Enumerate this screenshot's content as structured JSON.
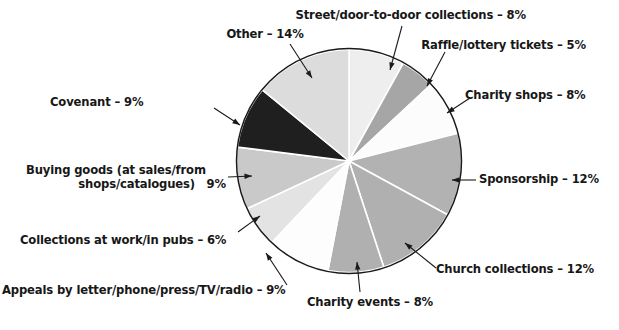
{
  "figure": {
    "type": "pie-chart-figure",
    "background": "#ffffff",
    "outline_color": "#1a1a1a",
    "leader_line_color": "#1a1a1a"
  },
  "chart_data": {
    "type": "pie",
    "title": "",
    "subtitle": "",
    "xlabel": "",
    "ylabel": "",
    "grid": false,
    "legend_position": "none",
    "label_style": "callout-with-leader-arrows",
    "units": "percent",
    "start_angle_deg": 0,
    "direction": "clockwise",
    "total": 100,
    "categories": [
      "Street/door-to-door collections",
      "Raffle/lottery tickets",
      "Charity shops",
      "Sponsorship",
      "Church collections",
      "Charity events",
      "Appeals by letter/phone/press/TV/radio",
      "Collections at work/in pubs",
      "Buying goods (at sales/from shops/catalogues)",
      "Covenant",
      "Other"
    ],
    "values": [
      8,
      5,
      8,
      12,
      12,
      8,
      9,
      6,
      9,
      9,
      14
    ],
    "colors": [
      "#eeeeee",
      "#a6a6a6",
      "#fcfcfc",
      "#b2b2b2",
      "#b0b0b0",
      "#b0b0b0",
      "#fdfdfd",
      "#e3e3e3",
      "#c9c9c9",
      "#201f1f",
      "#dcdcdc"
    ],
    "slices": [
      {
        "label": "Street/door-to-door collections",
        "value": 8,
        "display": "Street/door-to-door collections – 8%",
        "color": "#eeeeee"
      },
      {
        "label": "Raffle/lottery tickets",
        "value": 5,
        "display": "Raffle/lottery tickets – 5%",
        "color": "#a6a6a6"
      },
      {
        "label": "Charity shops",
        "value": 8,
        "display": "Charity shops – 8%",
        "color": "#fcfcfc"
      },
      {
        "label": "Sponsorship",
        "value": 12,
        "display": "Sponsorship – 12%",
        "color": "#b2b2b2"
      },
      {
        "label": "Church collections",
        "value": 12,
        "display": "Church collections – 12%",
        "color": "#b0b0b0"
      },
      {
        "label": "Charity events",
        "value": 8,
        "display": "Charity events – 8%",
        "color": "#b0b0b0"
      },
      {
        "label": "Appeals by letter/phone/press/TV/radio",
        "value": 9,
        "display": "Appeals by letter/phone/press/TV/radio – 9%",
        "color": "#fdfdfd"
      },
      {
        "label": "Collections at work/in pubs",
        "value": 6,
        "display": "Collections at work/in pubs – 6%",
        "color": "#e3e3e3"
      },
      {
        "label": "Buying goods (at sales/from shops/catalogues)",
        "value": 9,
        "display": "Buying goods (at sales/from shops/catalogues)  9%",
        "color": "#c9c9c9"
      },
      {
        "label": "Covenant",
        "value": 9,
        "display": "Covenant – 9%",
        "color": "#201f1f"
      },
      {
        "label": "Other",
        "value": 14,
        "display": "Other – 14%",
        "color": "#dcdcdc"
      }
    ]
  },
  "labels": {
    "street": "Street/door-to-door collections – 8%",
    "raffle": "Raffle/lottery tickets – 5%",
    "charity_shops": "Charity shops – 8%",
    "sponsorship": "Sponsorship – 12%",
    "church": "Church collections – 12%",
    "charity_events": "Charity events – 8%",
    "appeals": "Appeals by letter/phone/press/TV/radio – 9%",
    "work_pubs": "Collections at work/in pubs – 6%",
    "buying_line1": "Buying goods (at sales/from",
    "buying_line2": "shops/catalogues)   9%",
    "covenant": "Covenant – 9%",
    "other": "Other – 14%"
  }
}
